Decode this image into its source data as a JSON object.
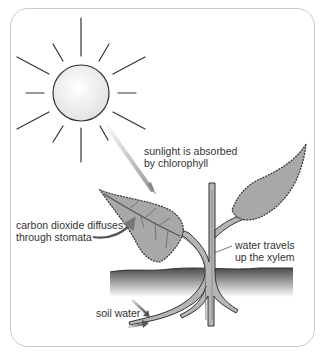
{
  "diagram": {
    "labels": {
      "sunlight": [
        "sunlight is absorbed",
        "by chlorophyll"
      ],
      "carbon_dioxide": [
        "carbon dioxide diffuses",
        "through stomata"
      ],
      "xylem": [
        "water travels",
        "up the xylem"
      ],
      "soil_water": [
        "soil water"
      ]
    },
    "elements": [
      "sun",
      "sunlight-arrow",
      "left-leaf",
      "right-leaf",
      "stem",
      "soil",
      "roots",
      "co2-arrow",
      "soil-water-arrows"
    ],
    "colors": {
      "frame": "#c8c8c8",
      "leaf_fill": "#a8a8a8",
      "stem_fill": "#b0b0b0",
      "outline": "#333333",
      "soil_top": "#555555",
      "text": "#333333"
    }
  }
}
